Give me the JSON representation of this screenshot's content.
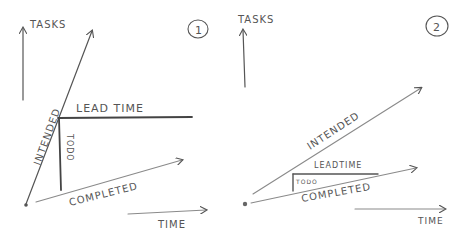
{
  "panels": [
    {
      "number": "1",
      "y_axis_label": "TASKS",
      "x_axis_label": "TIME",
      "lines": {
        "intended": "INTENDED",
        "completed": "COMPLETED",
        "lead_time": "LEAD TIME",
        "todo": "TODO"
      }
    },
    {
      "number": "2",
      "y_axis_label": "TASKS",
      "x_axis_label": "TIME",
      "lines": {
        "intended": "INTENDED",
        "completed": "COMPLETED",
        "lead_time": "LEADTIME",
        "todo": "TODO"
      }
    }
  ],
  "colors": {
    "ink": "#555555",
    "paper": "#ffffff"
  }
}
